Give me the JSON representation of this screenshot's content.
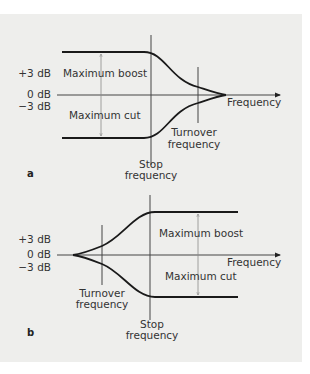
{
  "figure": {
    "panels": [
      {
        "id": "a",
        "label": "a",
        "y_labels": [
          "+3 dB",
          "0 dB",
          "−3 dB"
        ],
        "x_axis_label": "Frequency",
        "boost_label": "Maximum boost",
        "cut_label": "Maximum cut",
        "turnover_label": [
          "Turnover",
          "frequency"
        ],
        "stop_label": [
          "Stop",
          "frequency"
        ],
        "shelf_side": "low"
      },
      {
        "id": "b",
        "label": "b",
        "y_labels": [
          "+3 dB",
          "0 dB",
          "−3 dB"
        ],
        "x_axis_label": "Frequency",
        "boost_label": "Maximum boost",
        "cut_label": "Maximum cut",
        "turnover_label": [
          "Turnover",
          "frequency"
        ],
        "stop_label": [
          "Stop",
          "frequency"
        ],
        "shelf_side": "high"
      }
    ]
  },
  "colors": {
    "background": "#eeeeec",
    "curve": "#1a1a1a",
    "text": "#333333"
  }
}
